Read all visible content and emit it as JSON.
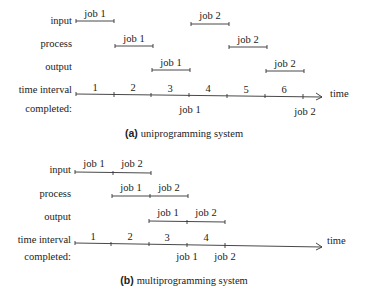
{
  "row_labels": {
    "input": "input",
    "process": "process",
    "output": "output",
    "time_interval": "time interval",
    "completed": "completed:",
    "time": "time"
  },
  "job_labels": {
    "job1": "job 1",
    "job2": "job 2"
  },
  "uniprogramming": {
    "caption_prefix": "(a)",
    "caption_text": "uniprogramming system",
    "intervals": [
      "1",
      "2",
      "3",
      "4",
      "5",
      "6"
    ],
    "input": [
      {
        "job": "job 1",
        "start": 0,
        "end": 1
      },
      {
        "job": "job 2",
        "start": 3,
        "end": 4
      }
    ],
    "process": [
      {
        "job": "job 1",
        "start": 1,
        "end": 2
      },
      {
        "job": "job 2",
        "start": 4,
        "end": 5
      }
    ],
    "output": [
      {
        "job": "job 1",
        "start": 2,
        "end": 3
      },
      {
        "job": "job 2",
        "start": 5,
        "end": 6
      }
    ],
    "completed": [
      {
        "job": "job 1",
        "at": 3
      },
      {
        "job": "job 2",
        "at": 6
      }
    ]
  },
  "multiprogramming": {
    "caption_prefix": "(b)",
    "caption_text": "multiprogramming system",
    "intervals": [
      "1",
      "2",
      "3",
      "4"
    ],
    "input": [
      {
        "job": "job 1",
        "start": 0,
        "end": 1
      },
      {
        "job": "job 2",
        "start": 1,
        "end": 2
      }
    ],
    "process": [
      {
        "job": "job 1",
        "start": 1,
        "end": 2
      },
      {
        "job": "job 2",
        "start": 2,
        "end": 3
      }
    ],
    "output": [
      {
        "job": "job 1",
        "start": 2,
        "end": 3
      },
      {
        "job": "job 2",
        "start": 3,
        "end": 4
      }
    ],
    "completed": [
      {
        "job": "job 1",
        "at": 3
      },
      {
        "job": "job 2",
        "at": 4
      }
    ]
  }
}
